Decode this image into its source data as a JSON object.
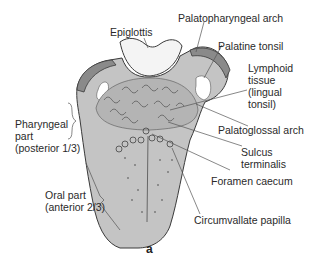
{
  "figure": {
    "panel_label": "a",
    "colors": {
      "tongue_fill": "#c4c4c4",
      "outline": "#3a3a3a",
      "tonsil_band": "#8a8a8a",
      "epiglottis_fill": "#f4f4f4",
      "leader_line": "#555555"
    }
  },
  "labels": {
    "epiglottis": "Epiglottis",
    "palatopharyngeal_arch": "Palatopharyngeal arch",
    "palatine_tonsil": "Palatine tonsil",
    "lymphoid_tissue": [
      "Lymphoid",
      "tissue",
      "(lingual",
      "tonsil)"
    ],
    "palatoglossal_arch": "Palatoglossal arch",
    "sulcus_terminalis": [
      "Sulcus",
      "terminalis"
    ],
    "foramen_caecum": "Foramen caecum",
    "circumvallate_papilla": "Circumvallate papilla",
    "pharyngeal_part": [
      "Pharyngeal",
      "part",
      "(posterior 1/3)"
    ],
    "oral_part": [
      "Oral part",
      "(anterior 2/3)"
    ]
  }
}
